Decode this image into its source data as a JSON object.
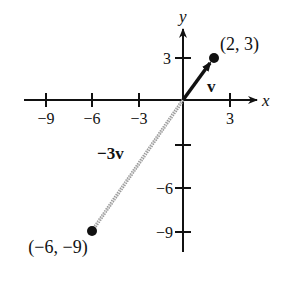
{
  "diagram": {
    "type": "vector-plot",
    "axes": {
      "x_label": "x",
      "y_label": "y",
      "x_ticks": [
        {
          "value": -9,
          "label": "−9"
        },
        {
          "value": -6,
          "label": "−6"
        },
        {
          "value": -3,
          "label": "−3"
        },
        {
          "value": 3,
          "label": "3"
        }
      ],
      "y_ticks": [
        {
          "value": 3,
          "label": "3"
        },
        {
          "value": -3,
          "label": ""
        },
        {
          "value": -6,
          "label": "−6"
        },
        {
          "value": -9,
          "label": "−9"
        }
      ]
    },
    "vectors": [
      {
        "name": "v",
        "label": "v",
        "from": [
          0,
          0
        ],
        "to": [
          2,
          3
        ],
        "style": "solid-arrow",
        "color": "#111111"
      },
      {
        "name": "-3v",
        "label": "−3v",
        "from": [
          0,
          0
        ],
        "to": [
          -6,
          -9
        ],
        "style": "hatched",
        "color": "#888888"
      }
    ],
    "points": [
      {
        "label": "(2, 3)",
        "x": 2,
        "y": 3
      },
      {
        "label": "(−6, −9)",
        "x": -6,
        "y": -9
      }
    ]
  }
}
